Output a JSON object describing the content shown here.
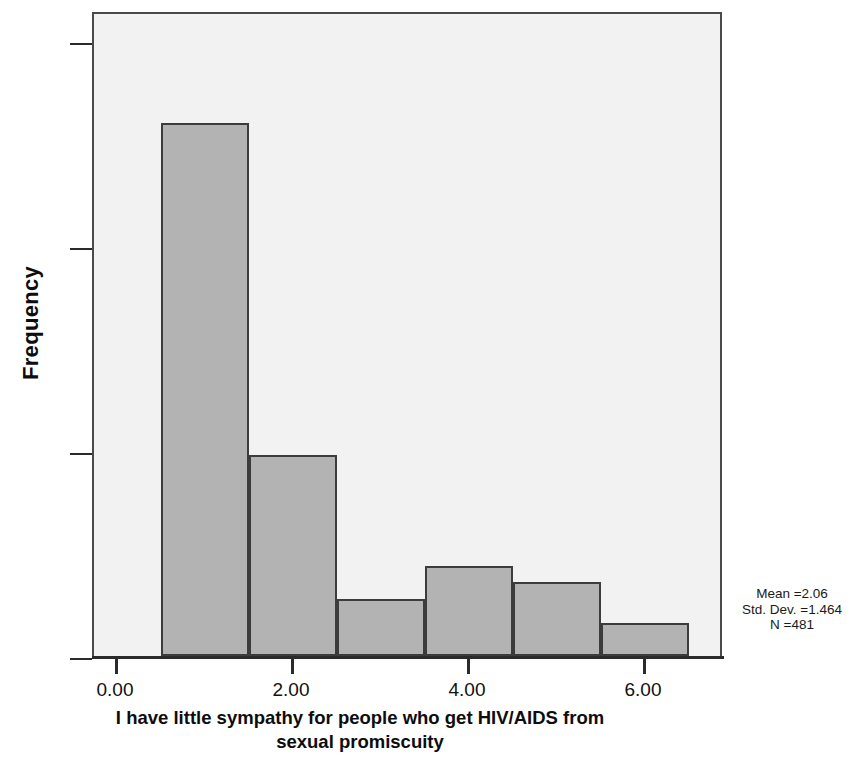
{
  "chart_data": {
    "type": "bar",
    "title": "",
    "subtitle": "",
    "xlabel": "I have little sympathy for people who get HIV/AIDS from sexual promiscuity",
    "ylabel": "Frequency",
    "xlim": [
      -0.7,
      7.2
    ],
    "ylim": [
      0,
      315
    ],
    "grid": false,
    "legend": null,
    "bin_width": 1.0,
    "categories": [
      "1",
      "2",
      "3",
      "4",
      "5",
      "6"
    ],
    "x": [
      1,
      2,
      3,
      4,
      5,
      6
    ],
    "values": [
      260,
      98,
      28,
      44,
      36,
      16
    ],
    "bin_edges": [
      0.5,
      1.5,
      2.5,
      3.5,
      4.5,
      5.5,
      6.5
    ],
    "xticks": [
      0,
      2,
      4,
      6
    ],
    "xtick_labels": [
      "0.00",
      "2.00",
      "4.00",
      "6.00"
    ],
    "yticks": [
      0,
      100,
      200,
      300
    ],
    "ytick_labels": [
      "0",
      "100",
      "200",
      "300"
    ],
    "bar_color": "#b3b3b3",
    "bar_edge_color": "#3c3c3c",
    "plot_background": "#f2f2f2",
    "annotations": {
      "mean": "Mean =2.06",
      "std_dev": "Std. Dev. =1.464",
      "n": "N =481"
    }
  },
  "axis": {
    "y_title": "Frequency",
    "x_title_line1": "I have little sympathy for people who get HIV/AIDS from",
    "x_title_line2": "sexual promiscuity"
  },
  "ticks": {
    "y": [
      {
        "label": "300",
        "value": 300
      },
      {
        "label": "200",
        "value": 200
      },
      {
        "label": "100",
        "value": 100
      },
      {
        "label": "0",
        "value": 0
      }
    ],
    "x": [
      {
        "label": "0.00",
        "value": 0
      },
      {
        "label": "2.00",
        "value": 2
      },
      {
        "label": "4.00",
        "value": 4
      },
      {
        "label": "6.00",
        "value": 6
      }
    ]
  },
  "stats": {
    "mean": "Mean =2.06",
    "std_dev": "Std. Dev. =1.464",
    "n": "N =481"
  }
}
